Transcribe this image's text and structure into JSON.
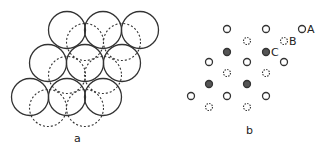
{
  "panel_a": {
    "label": "a",
    "radius": 18.5,
    "solid_circles": [
      [
        67,
        30
      ],
      [
        103,
        30
      ],
      [
        140,
        30
      ],
      [
        48,
        63
      ],
      [
        85,
        63
      ],
      [
        122,
        63
      ],
      [
        30,
        97
      ],
      [
        67,
        97
      ],
      [
        103,
        97
      ]
    ],
    "dashed_circles": [
      [
        85,
        42
      ],
      [
        122,
        42
      ],
      [
        67,
        75
      ],
      [
        103,
        75
      ],
      [
        48,
        108
      ],
      [
        85,
        108
      ]
    ]
  },
  "panel_b": {
    "label": "b",
    "radius": 3.5,
    "open_sites": [
      [
        227,
        29
      ],
      [
        266,
        29
      ],
      [
        302,
        29
      ],
      [
        209,
        62
      ],
      [
        247,
        62
      ],
      [
        284,
        62
      ],
      [
        191,
        96
      ],
      [
        227,
        96
      ],
      [
        266,
        96
      ]
    ],
    "dashed_sites": [
      [
        247,
        41
      ],
      [
        284,
        41
      ],
      [
        227,
        73
      ],
      [
        266,
        73
      ],
      [
        209,
        107
      ],
      [
        247,
        107
      ]
    ],
    "filled_sites": [
      [
        227,
        52
      ],
      [
        266,
        52
      ],
      [
        209,
        84
      ],
      [
        247,
        84
      ]
    ],
    "annotations": [
      {
        "text": "A",
        "x": 307,
        "y": 33
      },
      {
        "text": "B",
        "x": 289,
        "y": 45
      },
      {
        "text": "C",
        "x": 271,
        "y": 56
      }
    ]
  },
  "colors": {
    "stroke": "#333333",
    "fill_hatched": "#555555",
    "text": "#222222"
  }
}
